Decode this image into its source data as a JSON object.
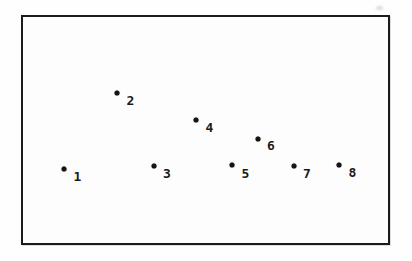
{
  "figure": {
    "background_color": "#fdfdfd",
    "frame_border_color": "#1b1b1b",
    "dot_color": "#141414",
    "label_color": "#1a1a1a",
    "dot_diameter_px": 5,
    "points": [
      {
        "label": "1",
        "dot_x": 64,
        "dot_y": 169,
        "label_x": 77.5,
        "label_y": 176
      },
      {
        "label": "2",
        "dot_x": 117,
        "dot_y": 93,
        "label_x": 130.5,
        "label_y": 100
      },
      {
        "label": "3",
        "dot_x": 153.5,
        "dot_y": 165.5,
        "label_x": 167,
        "label_y": 172.5
      },
      {
        "label": "4",
        "dot_x": 196,
        "dot_y": 119.5,
        "label_x": 209.5,
        "label_y": 126.5
      },
      {
        "label": "5",
        "dot_x": 232,
        "dot_y": 165,
        "label_x": 245.5,
        "label_y": 172.5
      },
      {
        "label": "6",
        "dot_x": 257.5,
        "dot_y": 138.5,
        "label_x": 271,
        "label_y": 145
      },
      {
        "label": "7",
        "dot_x": 293.5,
        "dot_y": 165.5,
        "label_x": 307,
        "label_y": 173
      },
      {
        "label": "8",
        "dot_x": 338.5,
        "dot_y": 164.5,
        "label_x": 352.5,
        "label_y": 172
      }
    ]
  }
}
